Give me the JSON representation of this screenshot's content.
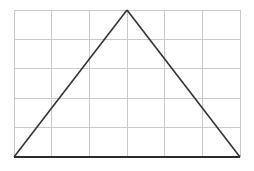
{
  "figure": {
    "type": "geometry-diagram",
    "canvas": {
      "width": 254,
      "height": 171,
      "background_color": "#ffffff"
    },
    "grid": {
      "name": "background-grid",
      "columns": 6,
      "rows": 5,
      "left": 14,
      "top": 10,
      "right": 240,
      "bottom": 157,
      "cell_width": 37.67,
      "cell_height": 29.4,
      "line_color": "#c9c9c9",
      "line_width": 1,
      "x_positions": [
        14,
        51.7,
        89.3,
        127,
        164.7,
        202.3,
        240
      ],
      "y_positions": [
        10,
        39.4,
        68.8,
        98.2,
        127.6,
        157
      ]
    },
    "triangle": {
      "name": "isosceles-triangle",
      "stroke_color": "#333333",
      "stroke_width": 1.6,
      "fill": "none",
      "vertices": [
        {
          "label": "bottom-left",
          "x": 14,
          "y": 157
        },
        {
          "label": "apex",
          "x": 127,
          "y": 10
        },
        {
          "label": "bottom-right",
          "x": 240,
          "y": 157
        }
      ],
      "base": {
        "name": "triangle-base",
        "x1": 14,
        "y1": 157,
        "x2": 240,
        "y2": 157,
        "stroke_width": 2.2,
        "stroke_color": "#2b2b2b",
        "spans_grid_columns": 6
      },
      "left_side": {
        "name": "triangle-left-side",
        "x1": 14,
        "y1": 157,
        "x2": 127,
        "y2": 10
      },
      "right_side": {
        "name": "triangle-right-side",
        "x1": 127,
        "y1": 10,
        "x2": 240,
        "y2": 157
      },
      "base_width_cells": 6,
      "height_cells": 5
    },
    "labels": []
  }
}
